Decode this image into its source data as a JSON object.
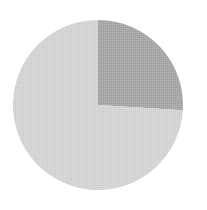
{
  "chart_data": {
    "type": "pie",
    "title": "",
    "start_angle_deg": 0,
    "direction": "clockwise",
    "slices": [
      {
        "label": "",
        "value": 26,
        "color": "#a8a8a8"
      },
      {
        "label": "",
        "value": 74,
        "color": "#d6d6d6"
      }
    ],
    "center": [
      98,
      105
    ],
    "radius": 85,
    "legend": false
  },
  "caption": ""
}
